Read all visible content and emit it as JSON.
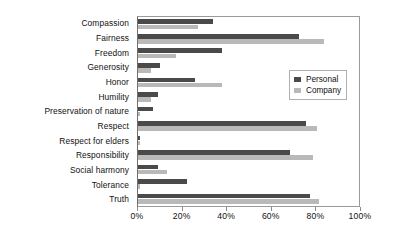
{
  "chart_data": {
    "type": "bar",
    "orientation": "horizontal",
    "title": "",
    "xlabel": "",
    "ylabel": "",
    "xlim": [
      0,
      100
    ],
    "xtick_labels": [
      "0%",
      "20%",
      "40%",
      "60%",
      "80%",
      "100%"
    ],
    "xtick_values": [
      0,
      20,
      40,
      60,
      80,
      100
    ],
    "grid": false,
    "legend_position": "right",
    "categories": [
      "Compassion",
      "Fairness",
      "Freedom",
      "Generosity",
      "Honor",
      "Humility",
      "Preservation of nature",
      "Respect",
      "Respect for elders",
      "Responsibility",
      "Social harmony",
      "Tolerance",
      "Truth"
    ],
    "series": [
      {
        "name": "Personal",
        "color": "#4a4a4a",
        "values": [
          34,
          73,
          38,
          10,
          26,
          9,
          7,
          76,
          1,
          69,
          9,
          22,
          78
        ]
      },
      {
        "name": "Company",
        "color": "#b9b9b9",
        "values": [
          27,
          84,
          17,
          6,
          38,
          6,
          1,
          81,
          1,
          79,
          13,
          1,
          82
        ]
      }
    ]
  }
}
